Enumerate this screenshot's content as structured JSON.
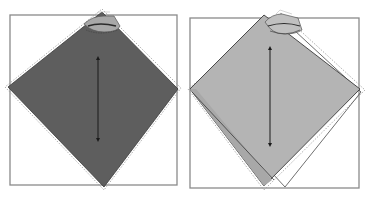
{
  "figure": {
    "panels": [
      {
        "id": "left",
        "frame": {
          "x": 10,
          "y": 15,
          "w": 167,
          "h": 170
        },
        "diamond": {
          "top": [
            102,
            12
          ],
          "right": [
            178,
            89
          ],
          "bottom": [
            104,
            187
          ],
          "left": [
            8,
            87
          ]
        },
        "fill": "#5e5e5e",
        "arrow": {
          "x": 98,
          "y1": 58,
          "y2": 140
        }
      },
      {
        "id": "right",
        "frame": {
          "x": 190,
          "y": 18,
          "w": 169,
          "h": 170
        },
        "diamond": {
          "top": [
            266,
            15
          ],
          "right": [
            362,
            90
          ],
          "bottom": [
            272,
            186
          ],
          "left": [
            190,
            89
          ]
        },
        "ghost_diamond": {
          "top": [
            281,
            18
          ],
          "right": [
            361,
            92
          ],
          "bottom": [
            285,
            187
          ],
          "left": [
            195,
            90
          ]
        },
        "fill": "#b4b4b4",
        "arrow": {
          "x": 270,
          "y1": 48,
          "y2": 145
        }
      }
    ],
    "colors": {
      "frame": "#8a8a8a",
      "outline": "#3a3a3a",
      "dotted": "#9a9a9a",
      "arrow": "#1a1a1a"
    }
  }
}
